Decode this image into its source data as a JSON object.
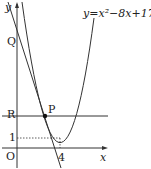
{
  "diagram": {
    "equation": "y=x²−8x+17",
    "axes": {
      "x_label": "x",
      "y_label": "y",
      "origin_label": "O"
    },
    "points": {
      "P": "P",
      "Q": "Q",
      "R": "R"
    },
    "ticks": {
      "y_one": "1",
      "x_four": "4"
    },
    "colors": {
      "stroke": "#333333",
      "background": "#ffffff"
    }
  }
}
